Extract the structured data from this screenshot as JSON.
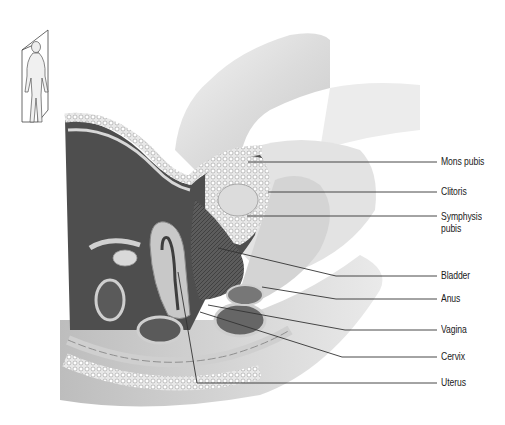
{
  "figure": {
    "inset": {
      "description": "Full female figure with sagittal section plane",
      "icon": "sagittal-plane-figure"
    },
    "labels": [
      {
        "id": "mons-pubis",
        "text": "Mons pubis",
        "y": 155
      },
      {
        "id": "clitoris",
        "text": "Clitoris",
        "y": 185
      },
      {
        "id": "symphysis-pubis",
        "text": "Symphysis pubis",
        "line1": "Symphysis",
        "line2": "pubis",
        "y": 209
      },
      {
        "id": "bladder",
        "text": "Bladder",
        "y": 269
      },
      {
        "id": "anus",
        "text": "Anus",
        "y": 292
      },
      {
        "id": "vagina",
        "text": "Vagina",
        "y": 323
      },
      {
        "id": "cervix",
        "text": "Cervix",
        "y": 350
      },
      {
        "id": "uterus",
        "text": "Uterus",
        "y": 376
      }
    ],
    "colors": {
      "background": "#ffffff",
      "leader_line": "#333333",
      "label_text": "#1a1a1a",
      "tissue_dark": "#5a5a5a",
      "skin": "#e6e6e6"
    }
  }
}
